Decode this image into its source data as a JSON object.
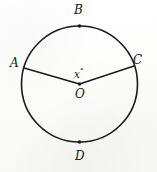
{
  "figure": {
    "kind": "circle-with-central-angle",
    "background_color": "#fdfdfd",
    "stroke_color": "#1a1a1a",
    "canvas": {
      "width": 157,
      "height": 172
    },
    "circle": {
      "cx": 79.5,
      "cy": 84,
      "r": 58,
      "stroke_width": 1.6
    },
    "center_point": {
      "name": "O",
      "x": 79.5,
      "y": 84,
      "dot_radius": 1.7
    },
    "points": [
      {
        "id": "A",
        "label": "A",
        "x": 24.0,
        "y": 68.0,
        "label_x": 10,
        "label_y": 57,
        "has_dot": false
      },
      {
        "id": "B",
        "label": "B",
        "x": 79.5,
        "y": 26.0,
        "label_x": 74,
        "label_y": 4,
        "has_dot": true
      },
      {
        "id": "C",
        "label": "C",
        "x": 134.0,
        "y": 66.0,
        "label_x": 133,
        "label_y": 54,
        "has_dot": false
      },
      {
        "id": "D",
        "label": "D",
        "x": 79.5,
        "y": 142.0,
        "label_x": 75,
        "label_y": 150,
        "has_dot": true
      }
    ],
    "radii": [
      {
        "id": "OA",
        "from": "O",
        "to": "A",
        "x1": 79.5,
        "y1": 84,
        "x2": 24.0,
        "y2": 68.0,
        "stroke_width": 1.4
      },
      {
        "id": "OC",
        "from": "O",
        "to": "C",
        "x1": 79.5,
        "y1": 84,
        "x2": 134.0,
        "y2": 66.0,
        "stroke_width": 1.4
      }
    ],
    "angle": {
      "id": "AOC",
      "variable": "x",
      "degree_symbol": "°",
      "label_x": 74,
      "label_y": 66
    },
    "center_label": {
      "text": "O",
      "x": 75,
      "y": 88
    }
  }
}
